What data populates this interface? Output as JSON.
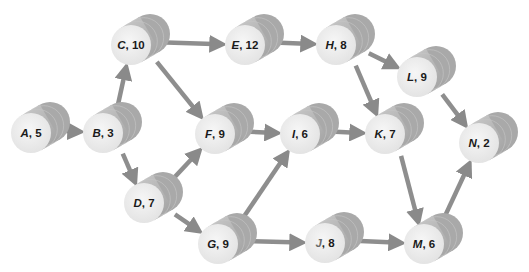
{
  "diagram": {
    "type": "activity-on-node network",
    "colors": {
      "background": "#ffffff",
      "cylinder_body": "#b8b8b8",
      "cylinder_body_dark": "#9e9e9e",
      "cylinder_face": "#ededed",
      "edge": "#8e8e8e",
      "label_text": "#1a1a1a"
    },
    "nodes": [
      {
        "id": "A",
        "letter": "A",
        "duration": "5",
        "label": "A, 5",
        "x": 31,
        "y": 133
      },
      {
        "id": "B",
        "letter": "B",
        "duration": "3",
        "label": "B, 3",
        "x": 103,
        "y": 133
      },
      {
        "id": "C",
        "letter": "C",
        "duration": "10",
        "label": "C, 10",
        "x": 131,
        "y": 45
      },
      {
        "id": "D",
        "letter": "D",
        "duration": "7",
        "label": "D, 7",
        "x": 144,
        "y": 203
      },
      {
        "id": "E",
        "letter": "E",
        "duration": "12",
        "label": "E, 12",
        "x": 245,
        "y": 45
      },
      {
        "id": "F",
        "letter": "F",
        "duration": "9",
        "label": "F, 9",
        "x": 215,
        "y": 134
      },
      {
        "id": "G",
        "letter": "G",
        "duration": "9",
        "label": "G, 9",
        "x": 218,
        "y": 244
      },
      {
        "id": "H",
        "letter": "H",
        "duration": "8",
        "label": "H, 8",
        "x": 336,
        "y": 45
      },
      {
        "id": "I",
        "letter": "I",
        "duration": "6",
        "label": "I, 6",
        "x": 300,
        "y": 134
      },
      {
        "id": "J",
        "letter": "J",
        "duration": "8",
        "label": "J, 8",
        "x": 325,
        "y": 243
      },
      {
        "id": "K",
        "letter": "K",
        "duration": "7",
        "label": "K, 7",
        "x": 385,
        "y": 134
      },
      {
        "id": "L",
        "letter": "L",
        "duration": "9",
        "label": "L, 9",
        "x": 417,
        "y": 77
      },
      {
        "id": "M",
        "letter": "M",
        "duration": "6",
        "label": "M, 6",
        "x": 424,
        "y": 244
      },
      {
        "id": "N",
        "letter": "N",
        "duration": "2",
        "label": "N, 2",
        "x": 479,
        "y": 143
      }
    ],
    "edges": [
      {
        "from": "A",
        "to": "B"
      },
      {
        "from": "B",
        "to": "C"
      },
      {
        "from": "B",
        "to": "D"
      },
      {
        "from": "C",
        "to": "E"
      },
      {
        "from": "C",
        "to": "F"
      },
      {
        "from": "D",
        "to": "F"
      },
      {
        "from": "D",
        "to": "G"
      },
      {
        "from": "E",
        "to": "H"
      },
      {
        "from": "F",
        "to": "I"
      },
      {
        "from": "G",
        "to": "I"
      },
      {
        "from": "G",
        "to": "J"
      },
      {
        "from": "H",
        "to": "L"
      },
      {
        "from": "H",
        "to": "K"
      },
      {
        "from": "I",
        "to": "K"
      },
      {
        "from": "J",
        "to": "M"
      },
      {
        "from": "K",
        "to": "M"
      },
      {
        "from": "L",
        "to": "N"
      },
      {
        "from": "M",
        "to": "N"
      }
    ]
  }
}
